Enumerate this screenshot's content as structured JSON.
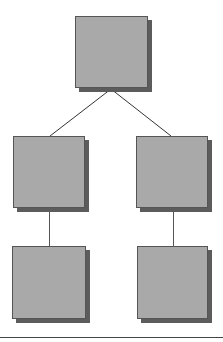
{
  "diagram": {
    "type": "tree",
    "colors": {
      "node_fill": "#a9a9a9",
      "node_border": "#555555",
      "node_shadow": "#5c5c5c",
      "connector": "#333333",
      "rule": "#444444",
      "background": "#ffffff"
    },
    "nodes": [
      {
        "id": "root",
        "label": "",
        "level": 0,
        "x": 75,
        "y": 16,
        "w": 73,
        "h": 72
      },
      {
        "id": "child-left",
        "label": "",
        "level": 1,
        "x": 13,
        "y": 136,
        "w": 72,
        "h": 72
      },
      {
        "id": "child-right",
        "label": "",
        "level": 1,
        "x": 136,
        "y": 136,
        "w": 72,
        "h": 72
      },
      {
        "id": "grandchild-left",
        "label": "",
        "level": 2,
        "x": 12,
        "y": 246,
        "w": 74,
        "h": 73
      },
      {
        "id": "grandchild-right",
        "label": "",
        "level": 2,
        "x": 137,
        "y": 246,
        "w": 71,
        "h": 73
      }
    ],
    "edges": [
      {
        "from": "root",
        "to": "child-left",
        "x1": 111,
        "y1": 89,
        "x2": 50,
        "y2": 136
      },
      {
        "from": "root",
        "to": "child-right",
        "x1": 111,
        "y1": 89,
        "x2": 171,
        "y2": 136
      },
      {
        "from": "child-left",
        "to": "grandchild-left",
        "x1": 49,
        "y1": 208,
        "x2": 49,
        "y2": 246
      },
      {
        "from": "child-right",
        "to": "grandchild-right",
        "x1": 173,
        "y1": 208,
        "x2": 173,
        "y2": 246
      }
    ]
  }
}
